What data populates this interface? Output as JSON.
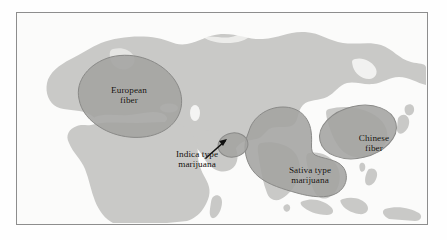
{
  "figure": {
    "kind": "distribution-map",
    "region_shown": "Eurasia and Africa",
    "colors": {
      "page_background": "#ffffff",
      "frame_border": "#8d8d8d",
      "ocean": "#fbfbfa",
      "landmass": "#c9c9c7",
      "overlay_region": "#a3a3a1",
      "overlay_outline": "#8a8a88",
      "label_text": "#120f0c",
      "arrow": "#101010"
    }
  },
  "regions": [
    {
      "id": "european-fiber",
      "line1": "European",
      "line2": "fiber",
      "shape": "ellipse",
      "center": [
        112,
        88
      ],
      "radii": [
        50,
        36
      ],
      "rotation_deg": -28
    },
    {
      "id": "chinese-fiber",
      "line1": "Chinese",
      "line2": "fiber",
      "shape": "ellipse",
      "center": [
        357,
        131
      ],
      "radii": [
        38,
        25
      ],
      "rotation_deg": -12
    },
    {
      "id": "sativa-type-marijuana",
      "line1": "Sativa type",
      "line2": "marijuana",
      "shape": "blob",
      "center": [
        293,
        163
      ]
    },
    {
      "id": "indica-type-marijuana",
      "line1": "Indica type",
      "line2": "marijuana",
      "shape": "small-ellipse",
      "center": [
        232,
        143
      ],
      "radii": [
        15,
        12
      ],
      "has_arrow": true
    }
  ],
  "annotations": {
    "arrow": {
      "name": "indica-pointer-arrow",
      "from": [
        206,
        157
      ],
      "to": [
        228,
        141
      ]
    }
  }
}
